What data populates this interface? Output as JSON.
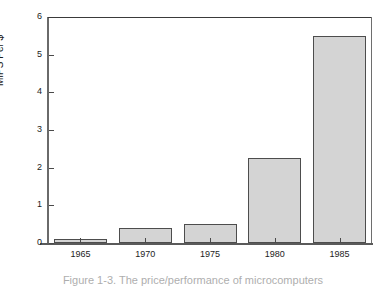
{
  "figure": {
    "background_color": "#ffffff",
    "caption": "Figure 1-3. The price/performance of microcomputers"
  },
  "chart_data": {
    "type": "bar",
    "title": "",
    "xlabel": "",
    "ylabel": "MIPS Per $",
    "categories": [
      "1965",
      "1970",
      "1975",
      "1980",
      "1985"
    ],
    "values": [
      0.1,
      0.4,
      0.5,
      2.25,
      5.5
    ],
    "ylim": [
      0,
      6
    ],
    "yticks": [
      0,
      1,
      2,
      3,
      4,
      5,
      6
    ],
    "ytick_labels": [
      "0",
      "1",
      "2",
      "3",
      "4",
      "5",
      "6"
    ],
    "xtick_labels": [
      "1965",
      "1970",
      "1975",
      "1980",
      "1985"
    ],
    "grid": false,
    "legend": false,
    "bar_fill_color": "#d4d4d4",
    "bar_edge_color": "#4d4d4d",
    "axis_color": "#5a5a5a"
  }
}
